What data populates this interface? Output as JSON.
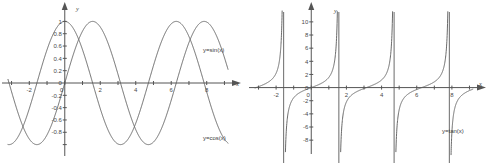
{
  "figure": {
    "background_color": "#ffffff",
    "curve_color": "#6a6a6a",
    "axis_color": "#555555",
    "panels": [
      "sine-cosine-plot",
      "tangent-plot"
    ]
  },
  "chart_data": [
    {
      "type": "line",
      "id": "sine-cosine-plot",
      "title": "",
      "xlabel": "x",
      "ylabel": "y",
      "xlim": [
        -3.2,
        9.2
      ],
      "ylim": [
        -1.12,
        1.12
      ],
      "grid": false,
      "legend": "inline-annotation",
      "xticks": [
        -3,
        -2,
        -1,
        0,
        1,
        2,
        3,
        4,
        5,
        6,
        7,
        8,
        9
      ],
      "xtick_labels": [
        "",
        "-2",
        "",
        "0",
        "",
        "2",
        "",
        "4",
        "",
        "6",
        "",
        "8",
        ""
      ],
      "yticks": [
        -1,
        -0.8,
        -0.6,
        -0.4,
        -0.2,
        0,
        0.2,
        0.4,
        0.6,
        0.8,
        1
      ],
      "ytick_labels": [
        "",
        "-0.8",
        "-0.6",
        "-0.4",
        "-0.2",
        "0",
        "0.2",
        "0.4",
        "0.6",
        "0.8",
        "1"
      ],
      "series": [
        {
          "name": "y=sin(x)",
          "label": "y=sin(x)",
          "function": "sin",
          "amplitude": 1,
          "period": 6.2832,
          "phase": 0,
          "label_position": {
            "x": 7.6,
            "y": 0.48
          },
          "zeros": [
            -3.1416,
            0,
            3.1416,
            6.2832
          ],
          "maxima": [
            {
              "x": 1.5708,
              "y": 1
            },
            {
              "x": 7.854,
              "y": 1
            }
          ],
          "minima": [
            {
              "x": -1.5708,
              "y": -1
            },
            {
              "x": 4.7124,
              "y": -1
            }
          ]
        },
        {
          "name": "y=cos(x)",
          "label": "y=cos(x)",
          "function": "cos",
          "amplitude": 1,
          "period": 6.2832,
          "phase": 1.5708,
          "label_position": {
            "x": 7.6,
            "y": -0.93
          },
          "zeros": [
            -1.5708,
            1.5708,
            4.7124,
            7.854
          ],
          "maxima": [
            {
              "x": 0,
              "y": 1
            },
            {
              "x": 6.2832,
              "y": 1
            }
          ],
          "minima": [
            {
              "x": -3.1416,
              "y": -1
            },
            {
              "x": 3.1416,
              "y": -1
            }
          ]
        }
      ]
    },
    {
      "type": "line",
      "id": "tangent-plot",
      "title": "",
      "xlabel": "x",
      "ylabel": "y",
      "xlim": [
        -3.2,
        9.2
      ],
      "ylim": [
        -9.5,
        11.2
      ],
      "grid": false,
      "legend": "inline-annotation",
      "xticks": [
        -3,
        -2,
        -1,
        0,
        1,
        2,
        3,
        4,
        5,
        6,
        7,
        8,
        9
      ],
      "xtick_labels": [
        "",
        "-2",
        "",
        "0",
        "",
        "2",
        "",
        "4",
        "",
        "6",
        "",
        "8",
        ""
      ],
      "yticks": [
        -8,
        -6,
        -4,
        -2,
        0,
        2,
        4,
        6,
        8,
        10
      ],
      "ytick_labels": [
        "-8",
        "-6",
        "-4",
        "-2",
        "0",
        "2",
        "4",
        "6",
        "8",
        "10"
      ],
      "series": [
        {
          "name": "y=tan(x)",
          "label": "y=tan(x)",
          "function": "tan",
          "period": 3.1416,
          "label_position": {
            "x": 7.2,
            "y": -6.4
          },
          "asymptotes": [
            -1.5708,
            1.5708,
            4.7124,
            7.854
          ],
          "zeros": [
            -3.1416,
            0,
            3.1416,
            6.2832
          ]
        }
      ]
    }
  ]
}
